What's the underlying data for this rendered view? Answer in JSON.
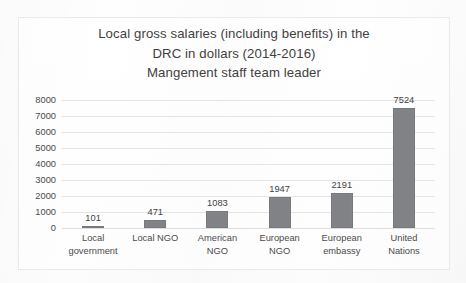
{
  "chart_data": {
    "type": "bar",
    "title": "Local gross salaries (including benefits) in the DRC in dollars (2014-2016) Mangement staff team leader",
    "title_lines": [
      "Local gross salaries (including benefits) in the",
      "DRC in dollars (2014-2016)",
      "Mangement staff team leader"
    ],
    "categories": [
      "Local government",
      "Local NGO",
      "American NGO",
      "European NGO",
      "European embassy",
      "United Nations"
    ],
    "category_lines": [
      [
        "Local",
        "government"
      ],
      [
        "Local NGO",
        ""
      ],
      [
        "American",
        "NGO"
      ],
      [
        "European",
        "NGO"
      ],
      [
        "European",
        "embassy"
      ],
      [
        "United",
        "Nations"
      ]
    ],
    "values": [
      101,
      471,
      1083,
      1947,
      2191,
      7524
    ],
    "value_labels": [
      "101",
      "471",
      "1083",
      "1947",
      "2191",
      "7524"
    ],
    "xlabel": "",
    "ylabel": "",
    "ylim": [
      0,
      8000
    ],
    "ytick_step": 1000,
    "yticks": [
      8000,
      7000,
      6000,
      5000,
      4000,
      3000,
      2000,
      1000,
      0
    ],
    "ytick_labels": [
      "8000",
      "7000",
      "6000",
      "5000",
      "4000",
      "3000",
      "2000",
      "1000",
      "0"
    ],
    "grid": true,
    "legend": false,
    "legend_position": "none",
    "bar_color": "#808285",
    "grid_color": "#e4e4e5",
    "text_color": "#3f3f3f",
    "background_color": "#fdfdfd",
    "frame_color": "#e9e9ea"
  }
}
